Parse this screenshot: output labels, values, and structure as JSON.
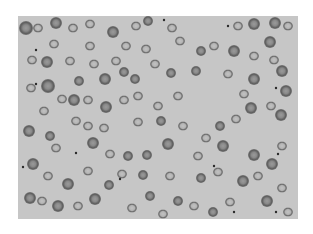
{
  "image": {
    "subject": "blood smear micrograph",
    "description": "Grayscale light microscopy of red blood cells, many with pale centers, scattered small dark platelets",
    "background_color": "#c6c6c6",
    "cell_color": "#6e6e6e",
    "cell_center_color": "#a8a8a8"
  }
}
